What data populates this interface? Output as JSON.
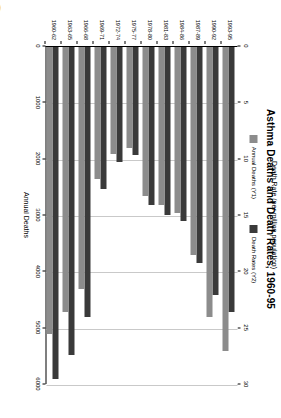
{
  "chart": {
    "title": "Asthma Deaths and Death Rates, 1960-95",
    "legend": [
      {
        "label": "Annual Deaths (Y1)",
        "color": "#8c8c8c"
      },
      {
        "label": "Death Rates (Y2)",
        "color": "#3a3a3a"
      }
    ]
  },
  "chart_data": {
    "type": "bar",
    "orientation": "horizontal",
    "title": "Asthma Deaths and Death Rates, 1960-95",
    "categories": [
      "1960-62",
      "1963-65",
      "1966-68",
      "1969-71",
      "1972-74",
      "1975-77",
      "1978-80",
      "1981-83",
      "1984-86",
      "1987-89",
      "1990-92",
      "1993-95"
    ],
    "series": [
      {
        "name": "Annual Deaths (Y1)",
        "axis": "Y1",
        "color": "#8c8c8c",
        "values": [
          5100,
          4700,
          4300,
          2350,
          1900,
          1800,
          2650,
          2800,
          2950,
          3700,
          4800,
          5400
        ]
      },
      {
        "name": "Death Rates (Y2)",
        "axis": "Y2",
        "color": "#3a3a3a",
        "values": [
          29.5,
          27.3,
          24.0,
          12.6,
          10.2,
          9.6,
          14.0,
          14.9,
          15.4,
          19.2,
          22.0,
          23.5
        ]
      }
    ],
    "xlabel": "Annual Deaths",
    "xlabel_secondary": "Death Rate (per million population)",
    "ylabel": "",
    "x_ticks": [
      0,
      1000,
      2000,
      3000,
      4000,
      5000,
      6000
    ],
    "x_ticks_secondary": [
      0,
      5,
      10,
      15,
      20,
      25,
      30
    ],
    "xlim": [
      0,
      6000
    ],
    "xlim_secondary": [
      0,
      30
    ],
    "grid": true,
    "legend_position": "top-center"
  }
}
